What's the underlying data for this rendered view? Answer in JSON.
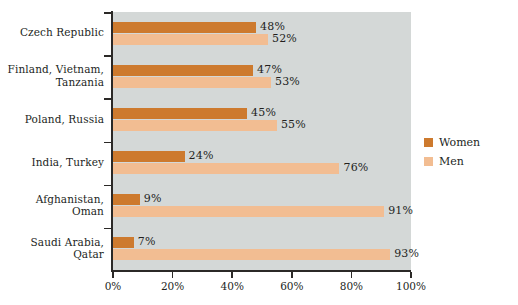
{
  "chart_data": {
    "type": "bar",
    "orientation": "horizontal",
    "title": "",
    "subtitle": "",
    "xlabel": "",
    "ylabel": "",
    "xlim": [
      0,
      100
    ],
    "xticks": [
      "0%",
      "20%",
      "40%",
      "60%",
      "80%",
      "100%"
    ],
    "xtick_values": [
      0,
      20,
      40,
      60,
      80,
      100
    ],
    "grid": false,
    "legend_position": "right",
    "categories": [
      "Czech Republic",
      "Finland, Vietnam, Tanzania",
      "Poland, Russia",
      "India, Turkey",
      "Afghanistan, Oman",
      "Saudi Arabia, Qatar"
    ],
    "category_lines": [
      [
        "Czech Republic"
      ],
      [
        "Finland, Vietnam,",
        "Tanzania"
      ],
      [
        "Poland, Russia"
      ],
      [
        "India, Turkey"
      ],
      [
        "Afghanistan,",
        "Oman"
      ],
      [
        "Saudi Arabia,",
        "Qatar"
      ]
    ],
    "series": [
      {
        "name": "Women",
        "color": "#cd7a2e",
        "values": [
          48,
          47,
          45,
          24,
          9,
          7
        ],
        "labels": [
          "48%",
          "47%",
          "45%",
          "24%",
          "9%",
          "7%"
        ]
      },
      {
        "name": "Men",
        "color": "#f2bd92",
        "values": [
          52,
          53,
          55,
          76,
          91,
          93
        ],
        "labels": [
          "52%",
          "53%",
          "55%",
          "76%",
          "91%",
          "93%"
        ]
      }
    ],
    "plot_background": "#d4d8d7",
    "axis_color": "#2b2927",
    "text_color": "#231f1d"
  },
  "legend": {
    "items": [
      {
        "label": "Women",
        "color": "#cd7a2e"
      },
      {
        "label": "Men",
        "color": "#f2bd92"
      }
    ]
  }
}
